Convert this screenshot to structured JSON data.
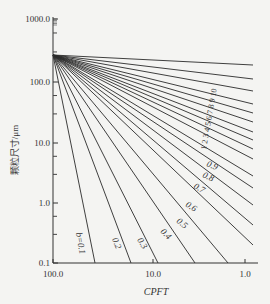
{
  "chart_data": {
    "type": "line",
    "title": "",
    "xlabel": "CPFT",
    "ylabel": "颗粒尺寸/μm",
    "x_scale": "log (reversed)",
    "y_scale": "log",
    "xlim": [
      100.0,
      1.0
    ],
    "ylim": [
      0.1,
      1000.0
    ],
    "x_ticks": [
      "100.0",
      "10.0",
      "1.0"
    ],
    "y_ticks": [
      "1000.0",
      "100.0",
      "10.0",
      "1.0",
      "0.1"
    ],
    "grid": false,
    "origin": {
      "cpft": 100.0,
      "size_um": 250
    },
    "series_labels": [
      "b=0.1",
      "0.2",
      "0.3",
      "0.4",
      "0.5",
      "0.6",
      "0.7",
      "0.8",
      "0.9",
      "1",
      "2",
      "3",
      "4",
      "5",
      "6",
      "7",
      "8",
      "9",
      "10"
    ],
    "lines_px": [
      {
        "label": "b=0.1",
        "x2": 95,
        "y2": 263
      },
      {
        "label": "0.2",
        "x2": 131,
        "y2": 263
      },
      {
        "label": "0.3",
        "x2": 158,
        "y2": 263
      },
      {
        "label": "0.4",
        "x2": 195,
        "y2": 263
      },
      {
        "label": "0.5",
        "x2": 228,
        "y2": 263
      },
      {
        "label": "0.6",
        "x2": 253,
        "y2": 245
      },
      {
        "label": "0.7",
        "x2": 253,
        "y2": 225
      },
      {
        "label": "0.8",
        "x2": 253,
        "y2": 205
      },
      {
        "label": "0.9",
        "x2": 253,
        "y2": 188
      },
      {
        "label": "1",
        "x2": 253,
        "y2": 176
      },
      {
        "label": "2",
        "x2": 253,
        "y2": 159
      },
      {
        "label": "3",
        "x2": 253,
        "y2": 149
      },
      {
        "label": "4",
        "x2": 253,
        "y2": 140
      },
      {
        "label": "5",
        "x2": 253,
        "y2": 132
      },
      {
        "label": "6",
        "x2": 253,
        "y2": 122
      },
      {
        "label": "7",
        "x2": 253,
        "y2": 113
      },
      {
        "label": "8",
        "x2": 253,
        "y2": 104
      },
      {
        "label": "9",
        "x2": 253,
        "y2": 91
      },
      {
        "label": "10",
        "x2": 253,
        "y2": 79
      },
      {
        "label": "",
        "x2": 253,
        "y2": 65
      }
    ],
    "annotations": [
      "b=0.1",
      "0.2",
      "0.3",
      "0.4",
      "0.5",
      "0.6",
      "0.7",
      "0.8",
      "0.9",
      "1",
      "2",
      "3",
      "4",
      "5",
      "6",
      "7",
      "8",
      "9",
      "10"
    ]
  },
  "axes": {
    "y_ticks": [
      {
        "label": "1000.0",
        "y": 19
      },
      {
        "label": "100.0",
        "y": 82
      },
      {
        "label": "10.0",
        "y": 143
      },
      {
        "label": "1.0",
        "y": 203
      },
      {
        "label": "0.1",
        "y": 263
      }
    ],
    "x_ticks": [
      {
        "label": "100.0",
        "x": 53
      },
      {
        "label": "10.0",
        "x": 153
      },
      {
        "label": "1.0",
        "x": 245
      }
    ],
    "xlabel": "CPFT",
    "ylabel": "颗粒尺寸/μm"
  },
  "labels": {
    "b01": "b=0.1",
    "b02": "0.2",
    "b03": "0.3",
    "b04": "0.4",
    "b05": "0.5",
    "b06": "0.6",
    "b07": "0.7",
    "b08": "0.8",
    "b09": "0.9",
    "top_sequence": "1 2 3 4 5 6 7 8 9 10"
  },
  "colors": {
    "line": "#2a2a2a",
    "background": "#f4f4f2",
    "text": "#333333"
  }
}
